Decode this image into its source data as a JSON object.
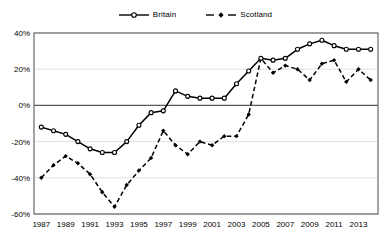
{
  "chart_data": {
    "type": "line",
    "title": "",
    "subtitle": "",
    "xlabel": "",
    "ylabel": "",
    "x": [
      1987,
      1988,
      1989,
      1990,
      1991,
      1992,
      1993,
      1994,
      1995,
      1996,
      1997,
      1998,
      1999,
      2000,
      2001,
      2002,
      2003,
      2004,
      2005,
      2006,
      2007,
      2008,
      2009,
      2010,
      2011,
      2012,
      2013,
      2014
    ],
    "xlim": [
      1986.4,
      2014.6
    ],
    "ylim": [
      -60,
      40
    ],
    "yticks": [
      40,
      20,
      0,
      -20,
      -40,
      -60
    ],
    "ytick_labels": [
      "40%",
      "20%",
      "0%",
      "-20%",
      "-40%",
      "-60%"
    ],
    "xticks": [
      1987,
      1989,
      1991,
      1993,
      1995,
      1997,
      1999,
      2001,
      2003,
      2005,
      2007,
      2009,
      2011,
      2013
    ],
    "xtick_labels": [
      "1987",
      "1989",
      "1991",
      "1993",
      "1995",
      "1997",
      "1999",
      "2001",
      "2003",
      "2005",
      "2007",
      "2009",
      "2011",
      "2013"
    ],
    "grid": true,
    "grid_axis": "y",
    "legend_position": "top-center",
    "zero_line": true,
    "series": [
      {
        "name": "Britain",
        "line_style": "solid",
        "marker": "open-circle",
        "color": "#000000",
        "values": [
          -12,
          -14,
          -16,
          -20,
          -24,
          -26,
          -26,
          -20,
          -11,
          -4,
          -3,
          8,
          5,
          4,
          4,
          4,
          12,
          19,
          26,
          25,
          26,
          31,
          34,
          36,
          33,
          31,
          31,
          31
        ]
      },
      {
        "name": "Scotland",
        "line_style": "dashed",
        "marker": "filled-diamond",
        "color": "#000000",
        "values": [
          -40,
          -33,
          -28,
          -32,
          -38,
          -48,
          -56,
          -44,
          -36,
          -29,
          -14,
          -22,
          -27,
          -20,
          -22,
          -17,
          -17,
          -5,
          26,
          18,
          22,
          20,
          14,
          23,
          25,
          13,
          20,
          14
        ]
      }
    ]
  },
  "legend": {
    "entries": [
      {
        "label": "Britain",
        "style": "solid",
        "marker": "open-circle"
      },
      {
        "label": "Scotland",
        "style": "dashed",
        "marker": "filled-diamond"
      }
    ]
  },
  "colors": {
    "line": "#000000",
    "grid": "#d9d9d9",
    "axis": "#595959",
    "background": "#ffffff"
  }
}
